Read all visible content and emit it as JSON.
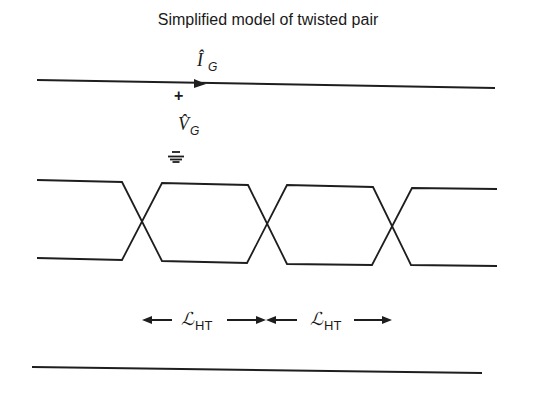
{
  "title": "Simplified model of twisted pair",
  "labels": {
    "current": {
      "symbol": "Î",
      "subscript": "G"
    },
    "voltage": {
      "symbol": "V̂",
      "subscript": "G"
    },
    "polarity": "+",
    "length_1": {
      "symbol": "ℒ",
      "subscript": "HT"
    },
    "length_2": {
      "symbol": "ℒ",
      "subscript": "HT"
    }
  },
  "icons": {
    "ground": "ground-symbol-icon",
    "current_arrow": "arrowhead-right-icon",
    "dimension_arrows": [
      "arrow-left-icon",
      "arrow-right-icon",
      "arrow-left-icon",
      "arrow-right-icon"
    ]
  },
  "elements": {
    "top_conductor": "single wire with current arrow",
    "twisted_pair": "two wires crossing three times",
    "bottom_conductor": "return plane / ground line"
  },
  "colors": {
    "line": "#1e1e1e",
    "background": "#ffffff"
  }
}
